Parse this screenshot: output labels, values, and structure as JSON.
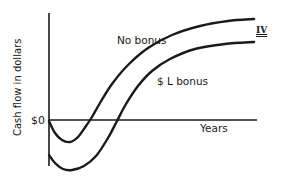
{
  "chart_data": {
    "type": "line",
    "title": "",
    "figure_label": "IV",
    "xlabel": "Years",
    "ylabel": "Cash flow in dollars",
    "y_tick_labels": [
      "$0"
    ],
    "grid": false,
    "legend": "inline labels",
    "series": [
      {
        "name": "No bonus",
        "description": "Starts at $0, dips negative early, crosses zero, then rises and levels off at the higher curve",
        "points_px": [
          [
            49,
            121
          ],
          [
            55,
            133
          ],
          [
            62,
            140
          ],
          [
            70,
            142
          ],
          [
            78,
            137
          ],
          [
            86,
            126
          ],
          [
            92,
            117
          ],
          [
            100,
            103
          ],
          [
            112,
            84
          ],
          [
            128,
            65
          ],
          [
            148,
            48
          ],
          [
            172,
            35
          ],
          [
            200,
            26
          ],
          [
            228,
            21
          ],
          [
            254,
            19
          ]
        ]
      },
      {
        "name": "$ L bonus",
        "description": "Starts further negative (after paying bonus), deeper dip, crosses zero later, then rises but stays below the no-bonus curve",
        "points_px": [
          [
            49,
            155
          ],
          [
            55,
            163
          ],
          [
            63,
            169
          ],
          [
            72,
            170
          ],
          [
            84,
            166
          ],
          [
            96,
            156
          ],
          [
            108,
            138
          ],
          [
            117,
            121
          ],
          [
            126,
            104
          ],
          [
            138,
            86
          ],
          [
            152,
            71
          ],
          [
            170,
            59
          ],
          [
            195,
            49
          ],
          [
            225,
            44
          ],
          [
            254,
            42
          ]
        ]
      }
    ],
    "axes": {
      "zero_line_y_px": 120,
      "x_range_px": [
        49,
        256
      ],
      "y_axis_x_px": 49
    }
  }
}
